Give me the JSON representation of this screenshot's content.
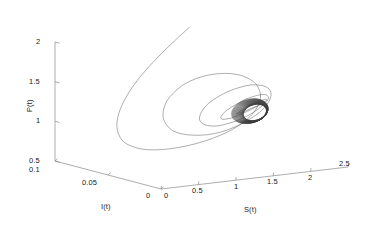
{
  "chart_data": {
    "type": "line",
    "title": "",
    "subtitle": "",
    "projection": "3d",
    "axes": {
      "x": {
        "label": "S(t)",
        "ticks": [
          "0",
          "0.5",
          "1",
          "1.5",
          "2",
          "2.5"
        ],
        "values": [
          0,
          0.5,
          1,
          1.5,
          2,
          2.5
        ],
        "lim": [
          0,
          2.5
        ]
      },
      "y": {
        "label": "I(t)",
        "ticks": [
          "0.1",
          "0.05",
          "0"
        ],
        "values": [
          0.1,
          0.05,
          0
        ],
        "lim": [
          0,
          0.1
        ]
      },
      "z": {
        "label": "P(t)",
        "ticks": [
          "0.5",
          "1",
          "1.5",
          "2"
        ],
        "values": [
          0.5,
          1,
          1.5,
          2
        ],
        "lim": [
          0.5,
          2
        ]
      }
    },
    "grid": false,
    "legend": null,
    "series": [
      {
        "name": "trajectory",
        "color": "#3c3c3c",
        "points_sx": [
          1.62,
          1.4,
          1.18,
          0.98,
          0.8,
          0.66,
          0.55,
          0.47,
          0.42,
          0.4,
          0.41,
          0.45,
          0.53,
          0.64,
          0.79,
          0.97,
          1.17,
          1.38,
          1.58,
          1.76,
          1.9,
          1.99,
          2.03,
          2.01,
          1.94,
          1.82,
          1.66,
          1.47,
          1.27,
          1.07,
          0.89,
          0.74,
          0.63,
          0.57,
          0.55,
          0.58,
          0.65,
          0.76,
          0.91,
          1.08,
          1.26,
          1.44,
          1.6,
          1.73,
          1.82,
          1.86,
          1.85,
          1.79,
          1.69,
          1.56,
          1.41,
          1.25,
          1.1,
          0.97,
          0.88,
          0.83,
          0.82,
          0.86,
          0.94,
          1.05,
          1.18,
          1.31,
          1.44,
          1.55,
          1.63,
          1.67,
          1.67,
          1.63,
          1.56,
          1.46,
          1.35,
          1.24,
          1.14,
          1.06,
          1.01,
          0.99,
          1.01,
          1.06,
          1.14,
          1.23,
          1.33,
          1.42,
          1.5,
          1.55,
          1.57,
          1.56,
          1.53,
          1.47,
          1.4,
          1.33,
          1.26,
          1.2,
          1.16,
          1.14,
          1.15,
          1.18,
          1.23,
          1.29,
          1.35,
          1.41
        ],
        "points_pz": [
          2.05,
          1.92,
          1.78,
          1.64,
          1.5,
          1.37,
          1.25,
          1.14,
          1.04,
          0.95,
          0.87,
          0.8,
          0.75,
          0.71,
          0.69,
          0.69,
          0.71,
          0.75,
          0.81,
          0.89,
          0.99,
          1.1,
          1.22,
          1.33,
          1.44,
          1.53,
          1.6,
          1.64,
          1.65,
          1.63,
          1.58,
          1.5,
          1.41,
          1.31,
          1.21,
          1.12,
          1.04,
          0.99,
          0.96,
          0.95,
          0.97,
          1.02,
          1.09,
          1.17,
          1.26,
          1.35,
          1.43,
          1.49,
          1.53,
          1.55,
          1.54,
          1.51,
          1.46,
          1.4,
          1.33,
          1.26,
          1.2,
          1.15,
          1.12,
          1.11,
          1.13,
          1.16,
          1.21,
          1.27,
          1.33,
          1.38,
          1.42,
          1.45,
          1.46,
          1.45,
          1.43,
          1.39,
          1.35,
          1.31,
          1.27,
          1.24,
          1.22,
          1.22,
          1.23,
          1.26,
          1.29,
          1.33,
          1.36,
          1.39,
          1.41,
          1.42,
          1.42,
          1.41,
          1.39,
          1.37,
          1.34,
          1.32,
          1.3,
          1.29,
          1.29,
          1.3,
          1.31,
          1.33,
          1.35,
          1.36
        ],
        "limit_cycle": {
          "center_s": 1.27,
          "center_p": 1.32,
          "radius_s": 0.17,
          "radius_p": 0.1
        }
      }
    ]
  },
  "labels": {
    "z_axis_title": "P(t)",
    "z_ticks": [
      "2",
      "1.5",
      "1",
      "0.5"
    ],
    "y_axis_title": "I(t)",
    "y_ticks": [
      "0.1",
      "0.05",
      "0"
    ],
    "x_axis_title": "S(t)",
    "x_ticks": [
      "0",
      "0.5",
      "1",
      "1.5",
      "2",
      "2.5"
    ]
  },
  "style": {
    "axis_color": "#7a7a7a",
    "curve_color": "#4a4a4a",
    "text_color": "#1a1a1a",
    "background": "#ffffff"
  }
}
